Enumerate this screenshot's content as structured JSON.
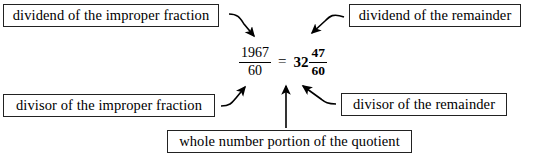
{
  "diagram": {
    "expression": {
      "improper": {
        "numerator": "1967",
        "denominator": "60"
      },
      "equals": "=",
      "mixed": {
        "whole": "32",
        "numerator": "47",
        "denominator": "60"
      }
    },
    "labels": {
      "dividend_improper": "dividend of the improper fraction",
      "dividend_remainder": "dividend of the remainder",
      "divisor_improper": "divisor of the improper fraction",
      "divisor_remainder": "divisor of the remainder",
      "whole_number": "whole number portion of the quotient"
    },
    "colors": {
      "ink": "#000000",
      "box_border": "#222222",
      "background": "#ffffff"
    }
  }
}
